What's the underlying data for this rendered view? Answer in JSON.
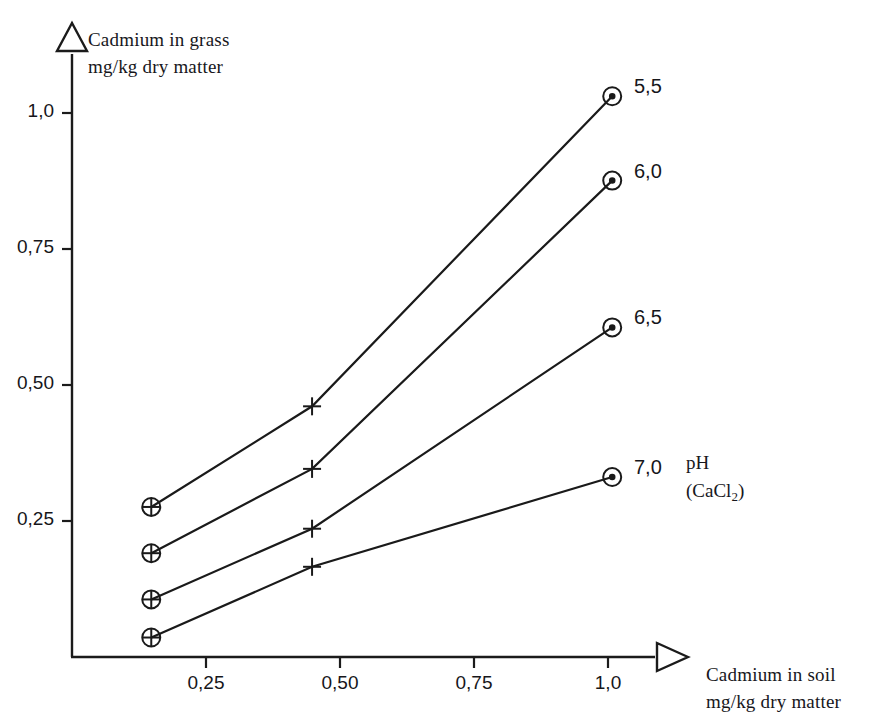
{
  "chart_data": {
    "type": "line",
    "title": "",
    "xlabel": "Cadmium in soil mg/kg dry matter",
    "ylabel": "Cadmium in grass mg/kg dry matter",
    "xlabel_line1": "Cadmium in soil",
    "xlabel_line2": "mg/kg dry matter",
    "ylabel_line1": "Cadmium in grass",
    "ylabel_line2": "mg/kg dry matter",
    "xlim": [
      0,
      1.2
    ],
    "ylim": [
      0,
      1.12
    ],
    "grid": false,
    "xticks": [
      0.25,
      0.5,
      0.75,
      1.0
    ],
    "xtick_labels": [
      "0,25",
      "0,50",
      "0,75",
      "1,0"
    ],
    "yticks": [
      0.25,
      0.5,
      0.75,
      1.0
    ],
    "ytick_labels": [
      "0,25",
      "0,50",
      "0,75",
      "1,0"
    ],
    "legend_title_line1": "pH",
    "legend_title_line2": "(CaCl",
    "legend_title_sub": "2",
    "legend_title_line2_end": ")",
    "legend_position": "right-inside",
    "x": [
      0.16,
      0.46,
      1.02
    ],
    "series": [
      {
        "name": "5,5",
        "label": "5,5",
        "values": [
          0.285,
          0.47,
          1.04
        ],
        "marker_left": "circle-plus",
        "marker_mid": "plus",
        "marker_right": "circle-dot"
      },
      {
        "name": "6,0",
        "label": "6,0",
        "values": [
          0.2,
          0.355,
          0.885
        ],
        "marker_left": "circle-plus",
        "marker_mid": "plus",
        "marker_right": "circle-dot"
      },
      {
        "name": "6,5",
        "label": "6,5",
        "values": [
          0.115,
          0.245,
          0.615
        ],
        "marker_left": "circle-plus",
        "marker_mid": "plus",
        "marker_right": "circle-dot"
      },
      {
        "name": "7,0",
        "label": "7,0",
        "values": [
          0.045,
          0.175,
          0.34
        ],
        "marker_left": "circle-plus",
        "marker_mid": "plus",
        "marker_right": "circle-dot"
      }
    ],
    "axis_arrow_x": "triangle-right",
    "axis_arrow_y": "triangle-up",
    "line_color": "#1a1a1a"
  },
  "caption_fragment": ""
}
